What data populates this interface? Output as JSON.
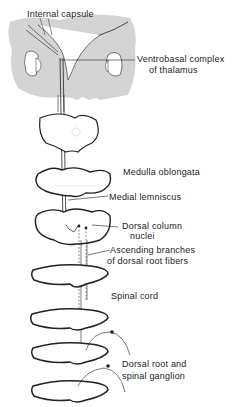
{
  "diagram": {
    "type": "anatomical pathway diagram",
    "colors": {
      "background": "#ffffff",
      "brain_fill": "#d4d4d4",
      "ink": "#222222"
    },
    "labels": {
      "internal_capsule": "Internal capsule",
      "ventrobasal_line1": "Ventrobasal complex",
      "ventrobasal_line2": "of thalamus",
      "medulla": "Medulla oblongata",
      "medial_lemniscus": "Medial lemniscus",
      "dorsal_column_line1": "Dorsal column",
      "dorsal_column_line2": "nuclei",
      "ascending_line1": "Ascending branches",
      "ascending_line2": "of dorsal root fibers",
      "spinal_cord": "Spinal cord",
      "dorsal_root_line1": "Dorsal root and",
      "dorsal_root_line2": "spinal ganglion"
    },
    "sections": [
      "thalamus/cerebrum",
      "midbrain",
      "upper medulla",
      "lower medulla",
      "upper spinal cord",
      "cervical spinal cord",
      "thoracic spinal cord",
      "lumbar spinal cord"
    ]
  }
}
